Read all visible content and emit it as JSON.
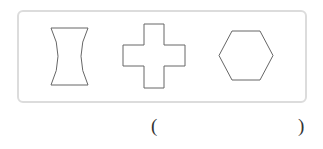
{
  "figure": {
    "shapes": [
      {
        "name": "concave-quadrilateral",
        "description": "shape with straight top and bottom edges and inward-curved left and right sides"
      },
      {
        "name": "cross",
        "description": "plus-shaped cross polygon"
      },
      {
        "name": "hexagon",
        "description": "regular hexagon"
      }
    ],
    "stroke_color": "#666666",
    "box_border_color": "#dcdcdc"
  },
  "answer": {
    "open_paren": "(",
    "close_paren": ")",
    "value": ""
  }
}
